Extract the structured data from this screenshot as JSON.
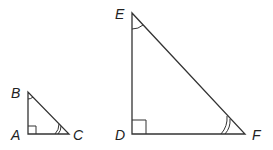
{
  "diagram": {
    "triangles": [
      {
        "name": "ABC",
        "vertices": {
          "A": [
            28,
            134
          ],
          "B": [
            28,
            92
          ],
          "C": [
            69,
            134
          ]
        },
        "right_angle_at": "A",
        "single_arc_at": "B",
        "double_arc_at": "C",
        "labels": {
          "A": "A",
          "B": "B",
          "C": "C"
        }
      },
      {
        "name": "DEF",
        "vertices": {
          "D": [
            132,
            134
          ],
          "E": [
            132,
            13
          ],
          "F": [
            245,
            134
          ]
        },
        "right_angle_at": "D",
        "single_arc_at": "E",
        "double_arc_at": "F",
        "labels": {
          "D": "D",
          "E": "E",
          "F": "F"
        }
      }
    ]
  }
}
